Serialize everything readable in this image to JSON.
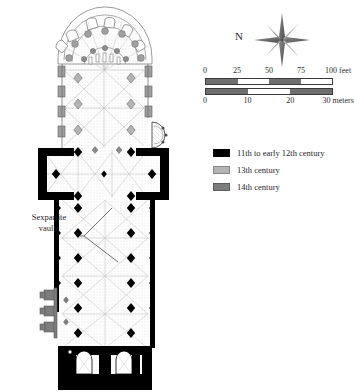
{
  "figure": {
    "kind": "architectural-floor-plan"
  },
  "compass": {
    "label": "N",
    "icon": "compass-rose-icon",
    "points": 8
  },
  "scale": {
    "feet": {
      "ticks": [
        "0",
        "25",
        "50",
        "75",
        "100"
      ],
      "unit_label": "100 feet",
      "max": 100
    },
    "meters": {
      "ticks": [
        "0",
        "10",
        "20",
        "30"
      ],
      "unit_label": "30 meters",
      "max": 30
    }
  },
  "legend": {
    "items": [
      {
        "label": "11th to early 12th century",
        "color": "#000000"
      },
      {
        "label": "13th century",
        "color": "#b4b4b4"
      },
      {
        "label": "14th century",
        "color": "#7d7d7d"
      }
    ]
  },
  "annotations": {
    "sexpartite": {
      "line1": "Sexpartite",
      "line2": "vaults"
    }
  },
  "plan_colors": {
    "phase_11_12c": "#000000",
    "phase_13c": "#b4b4b4",
    "phase_14c": "#7d7d7d",
    "wall_outline": "#555555",
    "vault_rib": "#9a9a9a",
    "hatch": "#bdbdbd"
  }
}
